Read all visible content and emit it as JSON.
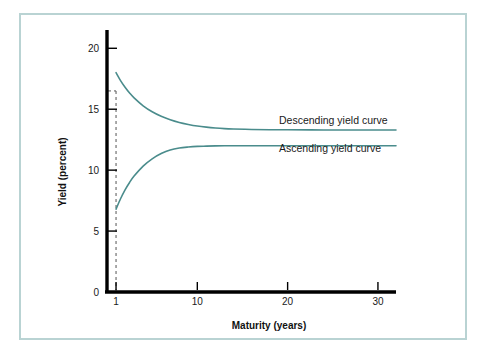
{
  "figure": {
    "frame_color": "#b9d3d3",
    "background": "#ffffff",
    "axis_color": "#000000",
    "curve_color": "#4a8c8c",
    "guide_color": "#555555"
  },
  "chart_data": {
    "type": "line",
    "title": "",
    "xlabel": "Maturity (years)",
    "ylabel": "Yield (percent)",
    "xlim": [
      0,
      32
    ],
    "ylim": [
      0,
      21.5
    ],
    "grid": false,
    "legend_position": "inline-right",
    "x_ticks": [
      1,
      10,
      20,
      30
    ],
    "x_tick_labels": [
      "1",
      "10",
      "20",
      "30"
    ],
    "y_ticks": [
      0,
      5,
      10,
      15,
      20
    ],
    "y_tick_labels": [
      "0",
      "5",
      "10",
      "15",
      "20"
    ],
    "annotations": [
      {
        "name": "maturity-one-guide",
        "type": "dashed-guide",
        "x": 1,
        "y_top": 16.5,
        "y_bottom": 0,
        "style": "dashed"
      }
    ],
    "series": [
      {
        "name": "Descending yield curve",
        "label": "Descending yield curve",
        "color": "#4a8c8c",
        "asymptote": 13.3,
        "start_value": 18.0,
        "x": [
          1,
          1.5,
          2,
          2.5,
          3,
          4,
          5,
          6,
          7,
          8,
          9,
          10,
          11,
          12,
          13,
          14,
          16,
          18,
          20,
          24,
          28,
          32
        ],
        "values": [
          18.0,
          17.35,
          16.8,
          16.33,
          15.93,
          15.28,
          14.79,
          14.42,
          14.13,
          13.91,
          13.75,
          13.62,
          13.53,
          13.46,
          13.41,
          13.38,
          13.34,
          13.32,
          13.31,
          13.3,
          13.3,
          13.3
        ]
      },
      {
        "name": "Ascending yield curve",
        "label": "Ascending yield curve",
        "color": "#4a8c8c",
        "asymptote": 12.0,
        "start_value": 6.8,
        "x": [
          1,
          1.5,
          2,
          2.5,
          3,
          4,
          5,
          6,
          7,
          8,
          9,
          10,
          11,
          12,
          13,
          14,
          16,
          18,
          20,
          24,
          28,
          32
        ],
        "values": [
          6.8,
          7.65,
          8.38,
          8.99,
          9.51,
          10.33,
          10.93,
          11.36,
          11.66,
          11.82,
          11.9,
          11.95,
          11.97,
          11.99,
          12.0,
          12.0,
          12.0,
          12.0,
          12.0,
          12.0,
          12.0,
          12.0
        ]
      }
    ]
  }
}
